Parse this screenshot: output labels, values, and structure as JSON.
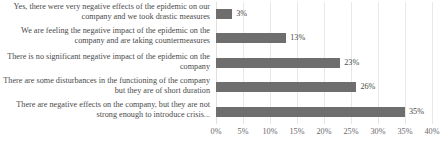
{
  "chart_data": {
    "type": "bar",
    "orientation": "horizontal",
    "title": "",
    "subtitle": "",
    "xlabel": "",
    "ylabel": "",
    "xlim": [
      0,
      40
    ],
    "xtick_labels": [
      "0%",
      "5%",
      "10%",
      "15%",
      "20%",
      "25%",
      "30%",
      "35%",
      "40%"
    ],
    "xtick_values": [
      0,
      5,
      10,
      15,
      20,
      25,
      30,
      35,
      40
    ],
    "grid": true,
    "legend": "none",
    "bar_color": "#6e6e6e",
    "categories": [
      "Yes, there were very negative effects of the epidemic on our company and we took drastic measures",
      "We are feeling the negative impact of the epidemic on the company and are taking countermeasures",
      "There is no significant negative impact of the epidemic on the company",
      "There are some disturbances in the functioning of the company but they are of short duration",
      "There are negative effects on the company, but they are not strong enough to introduce crisis..."
    ],
    "values": [
      3,
      13,
      23,
      26,
      35
    ],
    "value_labels": [
      "3%",
      "13%",
      "23%",
      "26%",
      "35%"
    ]
  }
}
